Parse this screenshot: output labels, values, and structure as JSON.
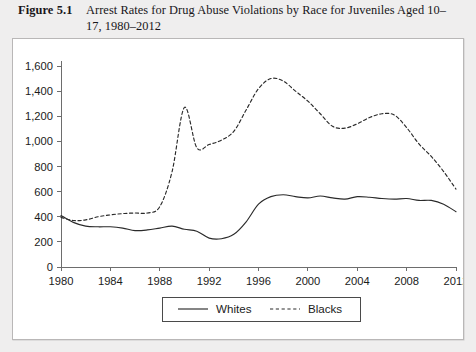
{
  "figure": {
    "number": "Figure 5.1",
    "title_line1": "Arrest Rates for Drug Abuse Violations by Race for Juveniles",
    "title_line2": "Aged 10–17, 1980–2012"
  },
  "colors": {
    "caption_band": "#efeeee",
    "plot_background": "#ffffff",
    "plot_border": "#b9b7b7",
    "axis": "#6d6d6d",
    "series": "#2a2a2a",
    "text": "#1b1b1b"
  },
  "chart_data": {
    "type": "line",
    "title": "Arrest Rates for Drug Abuse Violations by Race for Juveniles Aged 10–17, 1980–2012",
    "xlabel": "",
    "ylabel": "",
    "grid": false,
    "legend_position": "bottom-center",
    "xlim": [
      1980,
      2012
    ],
    "ylim": [
      0,
      1600
    ],
    "yticks": [
      0,
      200,
      400,
      600,
      800,
      1000,
      1200,
      1400,
      1600
    ],
    "ytick_labels": [
      "0",
      "200",
      "400",
      "600",
      "800",
      "1,000",
      "1,200",
      "1,400",
      "1,600"
    ],
    "xticks": [
      1980,
      1984,
      1988,
      1992,
      1996,
      2000,
      2004,
      2008,
      2012
    ],
    "xtick_labels": [
      "1980",
      "1984",
      "1988",
      "1992",
      "1996",
      "2000",
      "2004",
      "2008",
      "2012"
    ],
    "x": [
      1980,
      1981,
      1982,
      1983,
      1984,
      1985,
      1986,
      1987,
      1988,
      1989,
      1990,
      1991,
      1992,
      1993,
      1994,
      1995,
      1996,
      1997,
      1998,
      1999,
      2000,
      2001,
      2002,
      2003,
      2004,
      2005,
      2006,
      2007,
      2008,
      2009,
      2010,
      2011,
      2012
    ],
    "series": [
      {
        "name": "Whites",
        "style": "solid",
        "values": [
          410,
          355,
          325,
          320,
          320,
          310,
          290,
          295,
          310,
          325,
          300,
          285,
          230,
          225,
          260,
          360,
          500,
          560,
          575,
          560,
          550,
          565,
          550,
          540,
          560,
          555,
          545,
          540,
          545,
          530,
          530,
          500,
          440
        ]
      },
      {
        "name": "Blacks",
        "style": "dashed",
        "values": [
          395,
          370,
          375,
          400,
          415,
          425,
          430,
          430,
          480,
          760,
          1270,
          950,
          975,
          1010,
          1080,
          1250,
          1420,
          1500,
          1480,
          1400,
          1320,
          1220,
          1120,
          1105,
          1140,
          1190,
          1220,
          1210,
          1110,
          980,
          880,
          760,
          620
        ]
      }
    ]
  },
  "legend": {
    "items": [
      {
        "label": "Whites",
        "style": "solid"
      },
      {
        "label": "Blacks",
        "style": "dashed"
      }
    ]
  }
}
